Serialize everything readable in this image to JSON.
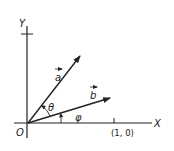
{
  "diagram": {
    "axes": {
      "x_label": "X",
      "y_label": "Y",
      "origin_label": "O",
      "unit_tick_label": "(1, 0)"
    },
    "vectors": [
      {
        "name": "a",
        "label": "a",
        "has_arrow_over": true
      },
      {
        "name": "b",
        "label": "b",
        "has_arrow_over": true
      }
    ],
    "angles": {
      "between_a_and_b": "θ",
      "b_from_x_axis": "φ"
    },
    "colors": {
      "stroke": "#222222",
      "background": "#ffffff"
    }
  }
}
